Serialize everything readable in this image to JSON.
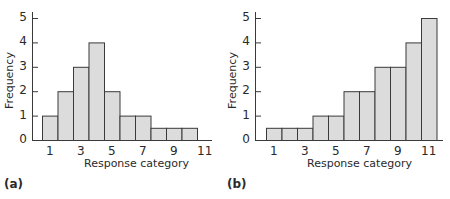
{
  "chart_data": [
    {
      "panel_label": "(a)",
      "type": "bar",
      "title": "",
      "xlabel": "Response category",
      "ylabel": "Frequency",
      "categories": [
        1,
        2,
        3,
        4,
        5,
        6,
        7,
        8,
        9,
        10
      ],
      "values": [
        1,
        2,
        3,
        4,
        2,
        1,
        1,
        0.5,
        0.5,
        0.5
      ],
      "xticks": [
        "1",
        "3",
        "5",
        "7",
        "9",
        "11"
      ],
      "yticks": [
        "0",
        "1",
        "2",
        "3",
        "4",
        "5"
      ],
      "ylim": [
        0,
        5
      ],
      "xlim": [
        0,
        11.5
      ],
      "grid": false,
      "bar_color": "#dcdcdc",
      "edge_color": "#3a3a3a"
    },
    {
      "panel_label": "(b)",
      "type": "bar",
      "title": "",
      "xlabel": "Response category",
      "ylabel": "Frequency",
      "categories": [
        1,
        2,
        3,
        4,
        5,
        6,
        7,
        8,
        9,
        10,
        11
      ],
      "values": [
        0.5,
        0.5,
        0.5,
        1,
        1,
        2,
        2,
        3,
        3,
        4,
        5
      ],
      "xticks": [
        "1",
        "3",
        "5",
        "7",
        "9",
        "11"
      ],
      "yticks": [
        "0",
        "1",
        "2",
        "3",
        "4",
        "5"
      ],
      "ylim": [
        0,
        5
      ],
      "xlim": [
        0,
        11.5
      ],
      "grid": false,
      "bar_color": "#dcdcdc",
      "edge_color": "#3a3a3a"
    }
  ]
}
